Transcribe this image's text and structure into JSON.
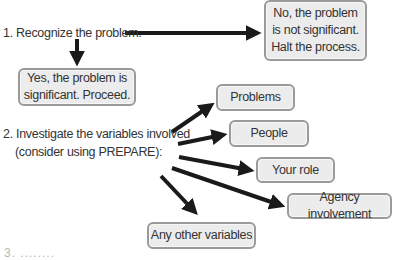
{
  "steps": {
    "step1": "1. Recognize the problem.",
    "step2_line1": "2. Investigate the variables involved",
    "step2_line2": "(consider using PREPARE):"
  },
  "outcomes": {
    "no_line1": "No, the problem",
    "no_line2": "is not significant.",
    "no_line3": "Halt the process.",
    "yes_line1": "Yes, the problem is",
    "yes_line2": "significant. Proceed."
  },
  "variables": [
    {
      "label": "Problems"
    },
    {
      "label": "People"
    },
    {
      "label": "Your role"
    },
    {
      "label": "Agency involvement"
    },
    {
      "label": "Any other variables"
    }
  ],
  "footer_cut_text": "3. ........",
  "colors": {
    "box_fill": "#ececec",
    "box_border": "#9a9a9a",
    "arrow": "#1a1a1a",
    "text": "#333333"
  }
}
